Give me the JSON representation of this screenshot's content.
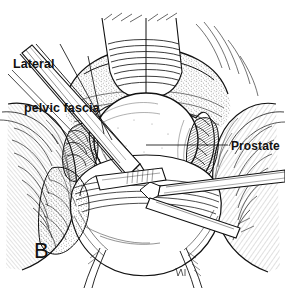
{
  "figure": {
    "domain": "medical-surgical-illustration",
    "panel_letter": "B",
    "style": "black and white pen-and-ink line drawing with cross-hatching",
    "background_color": "#ffffff",
    "ink_color": "#111111",
    "width": 285,
    "height": 288
  },
  "labels": {
    "lateral_pelvic_fascia": {
      "line1": "Lateral",
      "line2": "pelvic fascia",
      "full_text": "Lateral pelvic fascia",
      "position": "upper-left",
      "leader_lines": 2
    },
    "prostate": {
      "text": "Prostate",
      "position": "right",
      "leader_lines": 1
    }
  },
  "anatomy": {
    "structures": [
      "prostate gland",
      "lateral pelvic fascia",
      "periprostatic fatty tissue",
      "bladder neck",
      "puboprostatic region",
      "pelvic sidewall musculature"
    ]
  },
  "instruments": [
    {
      "name": "long-dissecting-scissors",
      "entry": "upper-left, angled down-right"
    },
    {
      "name": "right-angle-clamp",
      "entry": "right, horizontal toward center"
    },
    {
      "name": "retractor-blade",
      "entry": "lower-center"
    }
  ]
}
